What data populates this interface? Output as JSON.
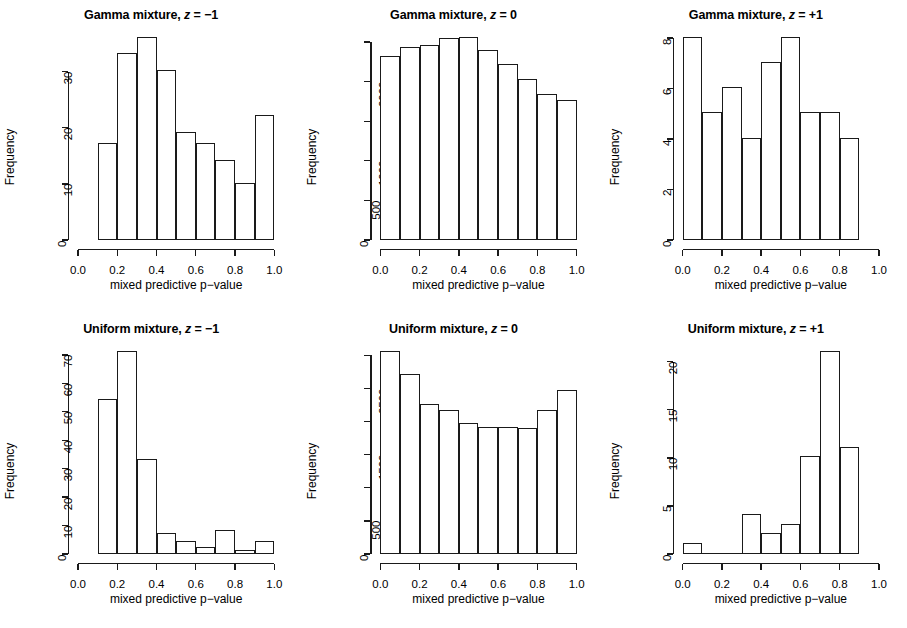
{
  "figure": {
    "rows": 2,
    "cols": 3,
    "background": "#ffffff",
    "ink": "#1a1a1a"
  },
  "chart_data": [
    {
      "type": "bar",
      "title": "Gamma mixture, z = −1",
      "title_prefix": "Gamma mixture, ",
      "title_var": "z",
      "title_suffix": " = −1",
      "xlabel": "mixed predictive p−value",
      "ylabel": "Frequency",
      "xlim": [
        0.0,
        1.0
      ],
      "ylim": [
        0,
        36
      ],
      "xticks": [
        0.0,
        0.2,
        0.4,
        0.6,
        0.8,
        1.0
      ],
      "xticklabels": [
        "0.0",
        "0.2",
        "0.4",
        "0.6",
        "0.8",
        "1.0"
      ],
      "yticks": [
        0,
        10,
        20,
        30
      ],
      "yticklabels": [
        "0",
        "10",
        "20",
        "30"
      ],
      "bin_edges": [
        0.0,
        0.1,
        0.2,
        0.3,
        0.4,
        0.5,
        0.6,
        0.7,
        0.8,
        0.9,
        1.0
      ],
      "values": [
        0,
        17,
        33,
        36,
        30,
        19,
        17,
        14,
        10,
        22
      ],
      "grid": false,
      "legend": null
    },
    {
      "type": "bar",
      "title": "Gamma mixture, z = 0",
      "title_prefix": "Gamma mixture, ",
      "title_var": "z",
      "title_suffix": " = 0",
      "xlabel": "mixed predictive p−value",
      "ylabel": "Frequency",
      "xlim": [
        0.0,
        1.0
      ],
      "ylim": [
        0,
        2550
      ],
      "xticks": [
        0.0,
        0.2,
        0.4,
        0.6,
        0.8,
        1.0
      ],
      "xticklabels": [
        "0.0",
        "0.2",
        "0.4",
        "0.6",
        "0.8",
        "1.0"
      ],
      "yticks": [
        0,
        500,
        1000,
        1500,
        2000,
        2500
      ],
      "yticklabels": [
        "0",
        "500",
        "1000",
        "",
        "2000",
        ""
      ],
      "bin_edges": [
        0.0,
        0.1,
        0.2,
        0.3,
        0.4,
        0.5,
        0.6,
        0.7,
        0.8,
        0.9,
        1.0
      ],
      "values": [
        2300,
        2420,
        2440,
        2530,
        2540,
        2380,
        2200,
        2020,
        1820,
        1750
      ],
      "grid": false,
      "legend": null
    },
    {
      "type": "bar",
      "title": "Gamma mixture, z = +1",
      "title_prefix": "Gamma mixture, ",
      "title_var": "z",
      "title_suffix": " = +1",
      "xlabel": "mixed predictive p−value",
      "ylabel": "Frequency",
      "xlim": [
        0.0,
        1.0
      ],
      "ylim": [
        0,
        8
      ],
      "xticks": [
        0.0,
        0.2,
        0.4,
        0.6,
        0.8,
        1.0
      ],
      "xticklabels": [
        "0.0",
        "0.2",
        "0.4",
        "0.6",
        "0.8",
        "1.0"
      ],
      "yticks": [
        0,
        2,
        4,
        6,
        8
      ],
      "yticklabels": [
        "0",
        "2",
        "4",
        "6",
        "8"
      ],
      "bin_edges": [
        0.0,
        0.1,
        0.2,
        0.3,
        0.4,
        0.5,
        0.6,
        0.7,
        0.8,
        0.9,
        1.0
      ],
      "values": [
        8,
        5,
        6,
        4,
        7,
        8,
        5,
        5,
        4,
        0
      ],
      "grid": false,
      "legend": null
    },
    {
      "type": "bar",
      "title": "Uniform mixture, z = −1",
      "title_prefix": "Uniform mixture, ",
      "title_var": "z",
      "title_suffix": " = −1",
      "xlabel": "mixed predictive p−value",
      "ylabel": "Frequency",
      "xlim": [
        0.0,
        1.0
      ],
      "ylim": [
        0,
        71
      ],
      "xticks": [
        0.0,
        0.2,
        0.4,
        0.6,
        0.8,
        1.0
      ],
      "xticklabels": [
        "0.0",
        "0.2",
        "0.4",
        "0.6",
        "0.8",
        "1.0"
      ],
      "yticks": [
        0,
        10,
        20,
        30,
        40,
        50,
        60,
        70
      ],
      "yticklabels": [
        "0",
        "10",
        "20",
        "30",
        "40",
        "50",
        "60",
        "70"
      ],
      "bin_edges": [
        0.0,
        0.1,
        0.2,
        0.3,
        0.4,
        0.5,
        0.6,
        0.7,
        0.8,
        0.9,
        1.0
      ],
      "values": [
        0,
        54,
        71,
        33,
        7,
        4,
        2,
        8,
        1,
        4
      ],
      "grid": false,
      "legend": null
    },
    {
      "type": "bar",
      "title": "Uniform mixture, z = 0",
      "title_prefix": "Uniform mixture, ",
      "title_var": "z",
      "title_suffix": " = 0",
      "xlabel": "mixed predictive p−value",
      "ylabel": "Frequency",
      "xlim": [
        0.0,
        1.0
      ],
      "ylim": [
        0,
        3050
      ],
      "xticks": [
        0.0,
        0.2,
        0.4,
        0.6,
        0.8,
        1.0
      ],
      "xticklabels": [
        "0.0",
        "0.2",
        "0.4",
        "0.6",
        "0.8",
        "1.0"
      ],
      "yticks": [
        0,
        500,
        1000,
        1500,
        2000,
        2500,
        3000
      ],
      "yticklabels": [
        "0",
        "500",
        "",
        "1500",
        "",
        "2500",
        ""
      ],
      "bin_edges": [
        0.0,
        0.1,
        0.2,
        0.3,
        0.4,
        0.5,
        0.6,
        0.7,
        0.8,
        0.9,
        1.0
      ],
      "values": [
        3050,
        2700,
        2250,
        2150,
        1950,
        1900,
        1900,
        1880,
        2150,
        2450
      ],
      "grid": false,
      "legend": null
    },
    {
      "type": "bar",
      "title": "Uniform mixture, z = +1",
      "title_prefix": "Uniform mixture, ",
      "title_var": "z",
      "title_suffix": " = +1",
      "xlabel": "mixed predictive p−value",
      "ylabel": "Frequency",
      "xlim": [
        0.0,
        1.0
      ],
      "ylim": [
        0,
        21
      ],
      "xticks": [
        0.0,
        0.2,
        0.4,
        0.6,
        0.8,
        1.0
      ],
      "xticklabels": [
        "0.0",
        "0.2",
        "0.4",
        "0.6",
        "0.8",
        "1.0"
      ],
      "yticks": [
        0,
        5,
        10,
        15,
        20
      ],
      "yticklabels": [
        "0",
        "5",
        "10",
        "15",
        "20"
      ],
      "bin_edges": [
        0.0,
        0.1,
        0.2,
        0.3,
        0.4,
        0.5,
        0.6,
        0.7,
        0.8,
        0.9,
        1.0
      ],
      "values": [
        1,
        0,
        0,
        4,
        2,
        3,
        10,
        21,
        11,
        0
      ],
      "grid": false,
      "legend": null
    }
  ]
}
